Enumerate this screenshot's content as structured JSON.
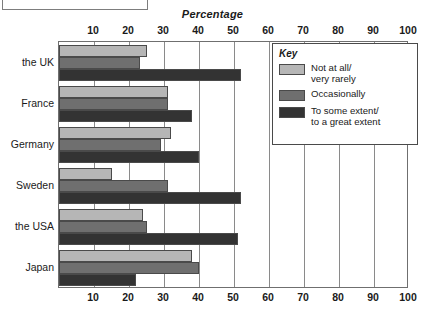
{
  "top_box": {
    "label": ""
  },
  "chart_data": {
    "type": "bar",
    "orientation": "horizontal",
    "title": "Percentage",
    "xlabel": "Percentage",
    "ylabel": "",
    "xlim": [
      0,
      100
    ],
    "xticks": [
      10,
      20,
      30,
      40,
      50,
      60,
      70,
      80,
      90,
      100
    ],
    "xtick_labels": [
      "10",
      "20",
      "30",
      "40",
      "50",
      "60",
      "70",
      "80",
      "90",
      "100"
    ],
    "grid": true,
    "axis_label_positions": [
      "top",
      "bottom"
    ],
    "legend_position": "top-right",
    "legend_title": "Key",
    "categories": [
      "the UK",
      "France",
      "Germany",
      "Sweden",
      "the USA",
      "Japan"
    ],
    "series": [
      {
        "name": "Not at all/\nvery rarely",
        "color": "#b6b6b6",
        "values": [
          25,
          31,
          32,
          15,
          24,
          38
        ]
      },
      {
        "name": "Occasionally",
        "color": "#6f6f6f",
        "values": [
          23,
          31,
          29,
          31,
          25,
          40
        ]
      },
      {
        "name": "To some extent/\nto a great extent",
        "color": "#333333",
        "values": [
          52,
          38,
          40,
          52,
          51,
          22
        ]
      }
    ]
  }
}
